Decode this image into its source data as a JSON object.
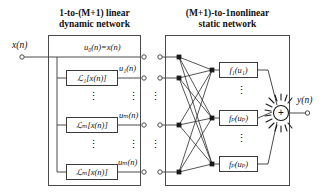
{
  "figure": {
    "kind": "block-diagram",
    "background": "#ffffff",
    "line_color": "#4a4a4a",
    "node_fill": "#1a1a1a",
    "box_border": "#3a3a3a"
  },
  "titles": {
    "left": "1-to-(M+1) linear\ndynamic network",
    "right": "(M+1)-to-1nonlinear\nstatic network"
  },
  "input": {
    "label": "x(n)"
  },
  "output": {
    "label": "y(n)"
  },
  "linear_branch": {
    "passthrough_label": "u₀(n)=x(n)",
    "blocks": [
      {
        "box": "ℒ₁[x(n)]",
        "signal": "u₁(n)"
      },
      {
        "box": "ℒₘ[x(n)]",
        "signal": "uₘ(n)"
      },
      {
        "box": "ℒₘ[x(n)]",
        "signal": "uₘ(n)"
      }
    ],
    "block_labels": [
      "ℒ₁[x(n)]",
      "ℒₘ[x(n)]",
      "ℒₘ[x(n)]"
    ]
  },
  "linear_rows": [
    {
      "box": "",
      "signal": "u₀(n)=x(n)"
    },
    {
      "box": "ℒ₁[x(n)]",
      "signal": "u₁(n)"
    },
    {
      "box": "ℒₘ[x(n)]",
      "signal": "uₘ(n)"
    },
    {
      "box": "ℒₘ[x(n)]",
      "signal": "uₘ(n)"
    }
  ],
  "boxes_left": [
    {
      "text": "ℒ₁[x(n)]"
    },
    {
      "text": "ℒₘ[x(n)]"
    },
    {
      "text": "ℒₘ[x(n)]"
    }
  ],
  "signals_left": [
    {
      "text": "u₀(n)=x(n)"
    },
    {
      "text": "u₁(n)"
    },
    {
      "text": "uₘ(n)"
    },
    {
      "text": "uₘ(n)"
    }
  ],
  "signal_left_0": "u₀(n)=x(n)",
  "signal_left_1": "u₁(n)",
  "signal_left_2": "uₘ(n)",
  "signal_left_3": "uₘ(n)",
  "box_left_1": "ℒ₁[x(n)]",
  "box_left_2": "ℒₘ[x(n)]",
  "box_left_3": "ℒₘ[x(n)]",
  "nonlinear": {
    "functions": [
      {
        "text": "f₁(u₁)"
      },
      {
        "text": "fₚ(uₚ)"
      },
      {
        "text": "fₚ(uₚ)"
      }
    ],
    "f1": "f₁(u₁)",
    "f2": "fₚ(uₚ)",
    "f3": "fₚ(uₚ)"
  },
  "summation": {
    "symbol": "+"
  },
  "ellipsis": {
    "glyph": "⋮"
  },
  "counts": {
    "linear_rows_drawn": 4,
    "nonlinear_rows_drawn": 3,
    "mesh_edges": 9
  }
}
